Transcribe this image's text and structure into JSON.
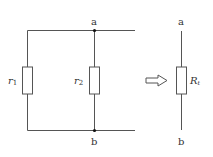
{
  "diagram": {
    "type": "circuit-equivalence",
    "left_circuit": {
      "nodes": [
        {
          "id": "a",
          "label": "a"
        },
        {
          "id": "b",
          "label": "b"
        }
      ],
      "resistors": [
        {
          "id": "r1",
          "label": "r",
          "subscript": "1"
        },
        {
          "id": "r2",
          "label": "r",
          "subscript": "2"
        }
      ],
      "connection": "parallel"
    },
    "arrow": {
      "direction": "right",
      "style": "hollow"
    },
    "right_circuit": {
      "nodes": [
        {
          "id": "a",
          "label": "a"
        },
        {
          "id": "b",
          "label": "b"
        }
      ],
      "resistor": {
        "id": "Rt",
        "label": "R",
        "subscript": "t"
      }
    }
  }
}
